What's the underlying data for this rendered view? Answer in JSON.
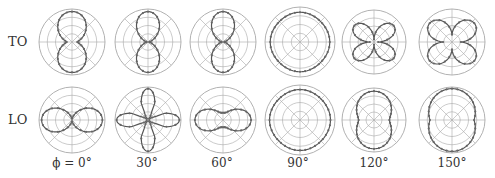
{
  "figure": {
    "row_labels": [
      "TO",
      "LO"
    ],
    "column_labels": [
      "ϕ = 0°",
      "30°",
      "60°",
      "90°",
      "120°",
      "150°"
    ]
  },
  "colors": {
    "grid": "#a8a8a8",
    "curve": "#555555",
    "marker": "#666666",
    "text": "#333333"
  },
  "chart_data": {
    "type": "polar-grid",
    "title": "",
    "rows": [
      "TO",
      "LO"
    ],
    "columns": [
      "ϕ = 0°",
      "30°",
      "60°",
      "90°",
      "120°",
      "150°"
    ],
    "grid": {
      "rings": 4,
      "spokes": 8,
      "rmax": 1.0
    },
    "panels": [
      {
        "row": "TO",
        "col": "ϕ = 0°",
        "shape": "vertical dumbbell (lobes along 90°/270°)",
        "r_max": 0.92,
        "r_min": 0.12
      },
      {
        "row": "TO",
        "col": "30°",
        "shape": "vertical figure-eight",
        "r_max": 0.92,
        "r_min": 0.05
      },
      {
        "row": "TO",
        "col": "60°",
        "shape": "vertical figure-eight",
        "r_max": 0.92,
        "r_min": 0.05
      },
      {
        "row": "TO",
        "col": "90°",
        "shape": "near-circle",
        "r_max": 0.85,
        "r_min": 0.82
      },
      {
        "row": "TO",
        "col": "120°",
        "shape": "horizontal butterfly (lobes toward 45°,135°,225°,315°)",
        "r_max": 0.85,
        "r_min": 0.08
      },
      {
        "row": "TO",
        "col": "150°",
        "shape": "horizontal butterfly, broader",
        "r_max": 0.92,
        "r_min": 0.22
      },
      {
        "row": "LO",
        "col": "ϕ = 0°",
        "shape": "horizontal figure-eight",
        "r_max": 0.92,
        "r_min": 0.05
      },
      {
        "row": "LO",
        "col": "30°",
        "shape": "four-lobe cross (vertical and horizontal)",
        "r_max": 0.95,
        "r_min": 0.05
      },
      {
        "row": "LO",
        "col": "60°",
        "shape": "horizontal figure-eight with small vertical lobes",
        "r_max": 0.85,
        "r_min": 0.12
      },
      {
        "row": "LO",
        "col": "90°",
        "shape": "near-circle",
        "r_max": 0.88,
        "r_min": 0.85
      },
      {
        "row": "LO",
        "col": "120°",
        "shape": "vertical peanut",
        "r_max": 0.9,
        "r_min": 0.48
      },
      {
        "row": "LO",
        "col": "150°",
        "shape": "vertical capsule",
        "r_max": 0.95,
        "r_min": 0.6
      }
    ]
  }
}
